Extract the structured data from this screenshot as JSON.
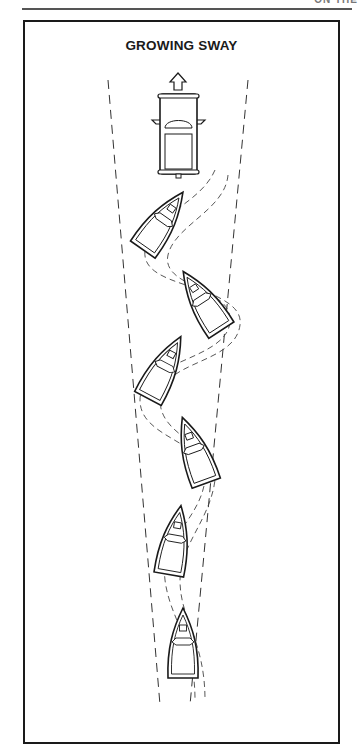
{
  "page": {
    "header_text": "ON THE"
  },
  "figure": {
    "title": "GROWING SWAY",
    "elements": {
      "tow_vehicle": "truck top view with forward arrow",
      "boats_count": 6,
      "path": "dashed sway path widening behind vehicle",
      "envelope": "two dashed lines diverging from bottom to top"
    }
  }
}
